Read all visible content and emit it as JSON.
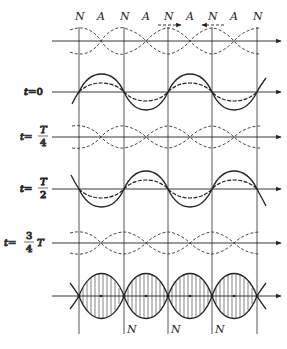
{
  "diagram": {
    "type": "standing-wave-formation",
    "top_labels": [
      "N",
      "A",
      "N",
      "A",
      "N",
      "A",
      "N",
      "A",
      "N"
    ],
    "bottom_labels": [
      "N",
      "N",
      "N"
    ],
    "rows": [
      {
        "id": "incident-waves",
        "label": ""
      },
      {
        "id": "t0",
        "label_prefix": "t=",
        "label_value": "0"
      },
      {
        "id": "tT4",
        "label_prefix": "t=",
        "frac_num": "T",
        "frac_den": "4"
      },
      {
        "id": "tT2",
        "label_prefix": "t=",
        "frac_num": "T",
        "frac_den": "2"
      },
      {
        "id": "t3T4",
        "label_prefix": "t=",
        "frac_num": "3",
        "frac_den": "4",
        "suffix": "T"
      },
      {
        "id": "envelope",
        "label": ""
      }
    ],
    "arrows": [
      {
        "direction": "right",
        "near_label_index": 4
      },
      {
        "direction": "left",
        "near_label_index": 6
      }
    ],
    "colors": {
      "line": "#222222",
      "background": "#ffffff"
    }
  }
}
